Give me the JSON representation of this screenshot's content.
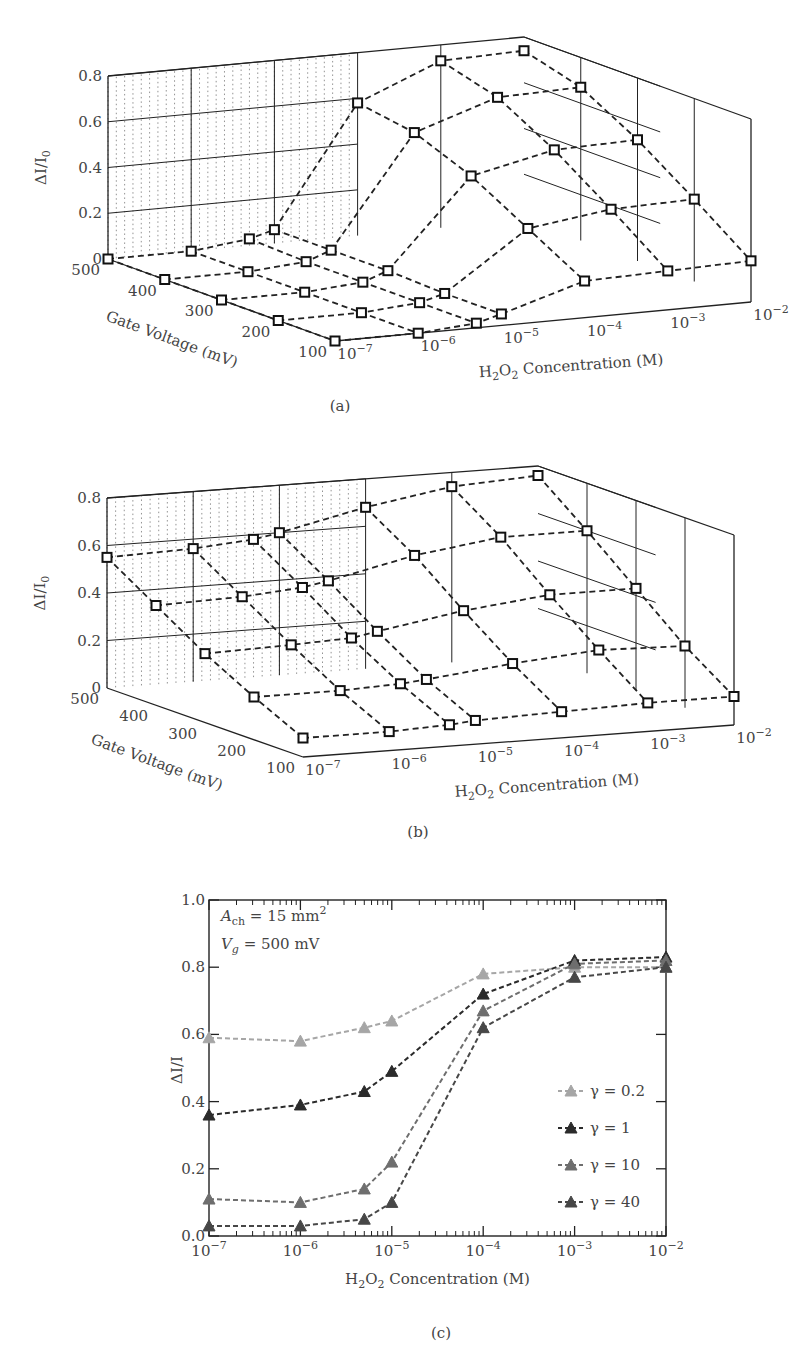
{
  "chart_data": [
    {
      "id": "a",
      "type": "surface3d",
      "caption": "(a)",
      "zlabel": "ΔI/I0",
      "xlabel": "H2O2 Concentration (M)",
      "ylabel": "Gate Voltage (mV)",
      "z_ticks": [
        "0",
        "0.2",
        "0.4",
        "0.6",
        "0.8"
      ],
      "zlim": [
        0,
        0.8
      ],
      "gate_voltage_ticks": [
        "500",
        "400",
        "300",
        "200",
        "100"
      ],
      "concentration_ticks": [
        "10^-7",
        "10^-6",
        "10^-5",
        "10^-4",
        "10^-3",
        "10^-2"
      ],
      "concentrations": [
        1e-07,
        1e-06,
        5e-06,
        1e-05,
        0.0001,
        0.001,
        0.01
      ],
      "gate_voltages_mV": [
        500,
        400,
        300,
        200,
        100
      ],
      "marker": "square",
      "values": [
        [
          0.0,
          0.0,
          0.03,
          0.06,
          0.58,
          0.73,
          0.74
        ],
        [
          0.0,
          0.0,
          0.02,
          0.06,
          0.54,
          0.66,
          0.67
        ],
        [
          0.0,
          0.0,
          0.02,
          0.06,
          0.44,
          0.52,
          0.53
        ],
        [
          0.0,
          0.0,
          0.02,
          0.05,
          0.3,
          0.35,
          0.36
        ],
        [
          0.0,
          0.0,
          0.02,
          0.05,
          0.16,
          0.17,
          0.18
        ]
      ]
    },
    {
      "id": "b",
      "type": "surface3d",
      "caption": "(b)",
      "zlabel": "ΔI/I0",
      "xlabel": "H2O2 Concentration (M)",
      "ylabel": "Gate Voltage (mV)",
      "z_ticks": [
        "0",
        "0.2",
        "0.4",
        "0.6",
        "0.8"
      ],
      "zlim": [
        0,
        0.8
      ],
      "gate_voltage_ticks": [
        "500",
        "400",
        "300",
        "200",
        "100"
      ],
      "concentration_ticks": [
        "10^-7",
        "10^-6",
        "10^-5",
        "10^-4",
        "10^-3",
        "10^-2"
      ],
      "concentrations": [
        1e-07,
        1e-06,
        5e-06,
        1e-05,
        0.0001,
        0.001,
        0.01
      ],
      "gate_voltages_mV": [
        500,
        400,
        300,
        200,
        100
      ],
      "marker": "square",
      "values": [
        [
          0.55,
          0.56,
          0.58,
          0.6,
          0.68,
          0.74,
          0.76
        ],
        [
          0.42,
          0.43,
          0.45,
          0.47,
          0.55,
          0.6,
          0.6
        ],
        [
          0.29,
          0.3,
          0.31,
          0.33,
          0.39,
          0.43,
          0.43
        ],
        [
          0.18,
          0.18,
          0.19,
          0.2,
          0.24,
          0.27,
          0.26
        ],
        [
          0.08,
          0.08,
          0.09,
          0.1,
          0.11,
          0.12,
          0.12
        ]
      ]
    },
    {
      "id": "c",
      "type": "line",
      "caption": "(c)",
      "title": "",
      "xlabel": "H2O2 Concentration (M)",
      "ylabel": "ΔI/I",
      "xscale": "log",
      "xlim": [
        1e-07,
        0.01
      ],
      "ylim": [
        0.0,
        1.0
      ],
      "x_ticks": [
        "10^-7",
        "10^-6",
        "10^-5",
        "10^-4",
        "10^-3",
        "10^-2"
      ],
      "y_ticks": [
        "0.0",
        "0.2",
        "0.4",
        "0.6",
        "0.8",
        "1.0"
      ],
      "annotations": [
        "A_ch = 15 mm^2",
        "V_g = 500 mV"
      ],
      "legend_position": "lower right",
      "grid": false,
      "x": [
        1e-07,
        1e-06,
        5e-06,
        1e-05,
        0.0001,
        0.001,
        0.01
      ],
      "series": [
        {
          "name": "γ = 0.2",
          "color": "#a6a6a6",
          "marker": "triangle",
          "values": [
            0.59,
            0.58,
            0.62,
            0.64,
            0.78,
            0.8,
            0.8
          ]
        },
        {
          "name": "γ = 1",
          "color": "#2b2b2b",
          "marker": "triangle",
          "values": [
            0.36,
            0.39,
            0.43,
            0.49,
            0.72,
            0.82,
            0.83
          ]
        },
        {
          "name": "γ = 10",
          "color": "#6e6e6e",
          "marker": "triangle",
          "values": [
            0.11,
            0.1,
            0.14,
            0.22,
            0.67,
            0.81,
            0.82
          ]
        },
        {
          "name": "γ = 40",
          "color": "#474747",
          "marker": "triangle",
          "values": [
            0.03,
            0.03,
            0.05,
            0.1,
            0.62,
            0.77,
            0.8
          ]
        }
      ]
    }
  ],
  "labels": {
    "fig_a_caption": "(a)",
    "fig_b_caption": "(b)",
    "fig_c_caption": "(c)",
    "c_annotation_area": "A",
    "c_annotation_area_sub": "ch",
    "c_annotation_area_value": " = 15 mm",
    "c_annotation_area_sup": "2",
    "c_annotation_vg": "V",
    "c_annotation_vg_sub": "g",
    "c_annotation_vg_value": " = 500 mV"
  }
}
